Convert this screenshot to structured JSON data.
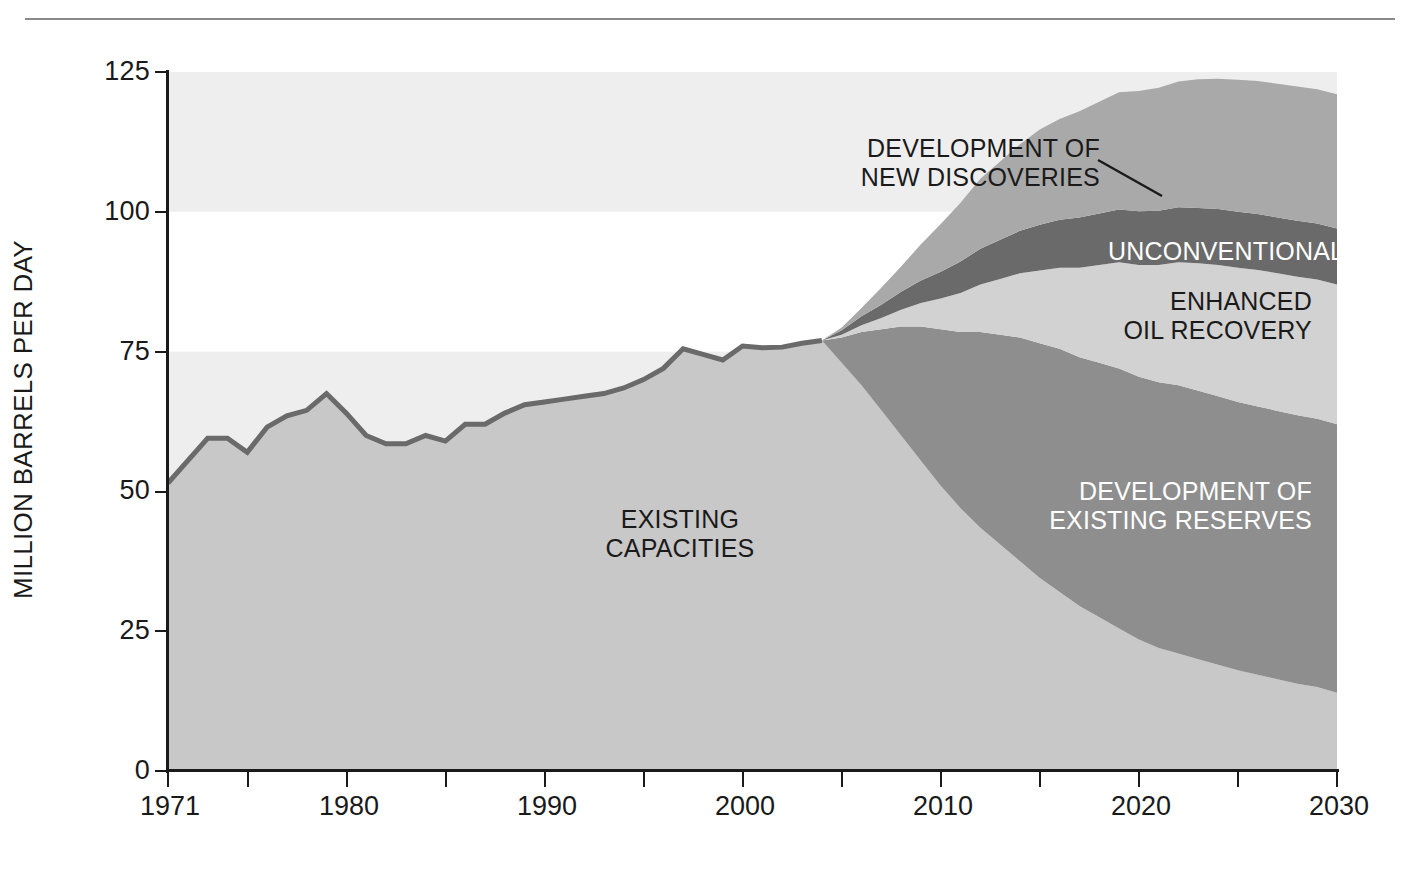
{
  "figure": {
    "y_axis_title": "MILLION BARRELS PER DAY",
    "y_ticks": [
      "0",
      "25",
      "50",
      "75",
      "100",
      "125"
    ],
    "x_ticks_labeled": [
      "1971",
      "1980",
      "1990",
      "2000",
      "2010",
      "2020",
      "2030"
    ]
  },
  "annotations": {
    "new_discoveries": "DEVELOPMENT OF\nNEW DISCOVERIES",
    "unconventional": "UNCONVENTIONAL",
    "enhanced_oil_recovery": "ENHANCED\nOIL RECOVERY",
    "existing_reserves": "DEVELOPMENT OF\nEXISTING RESERVES",
    "existing_capacities": "EXISTING\nCAPACITIES"
  },
  "colors": {
    "band_light": "#eeeeee",
    "band_white": "#ffffff",
    "existing_capacities": "#c8c8c8",
    "existing_reserves": "#8e8e8e",
    "enhanced_oil_recovery": "#d2d2d2",
    "unconventional": "#6a6a6a",
    "new_discoveries": "#a9a9a9",
    "axis": "#1a1a1a",
    "rule": "#8a8a8a"
  },
  "chart_data": {
    "type": "area",
    "title": "",
    "xlabel": "",
    "ylabel": "MILLION BARRELS PER DAY",
    "xlim": [
      1971,
      2030
    ],
    "ylim": [
      0,
      125
    ],
    "grid": "horizontal alternating shaded bands every 25 units",
    "legend": "in-plot labels on each stacked band",
    "stacking": "bottom-to-top: existing capacities, development of existing reserves, enhanced oil recovery, unconventional, development of new discoveries",
    "x": [
      1971,
      1972,
      1973,
      1974,
      1975,
      1976,
      1977,
      1978,
      1979,
      1980,
      1981,
      1982,
      1983,
      1984,
      1985,
      1986,
      1987,
      1988,
      1989,
      1990,
      1991,
      1992,
      1993,
      1994,
      1995,
      1996,
      1997,
      1998,
      1999,
      2000,
      2001,
      2002,
      2003,
      2004,
      2005,
      2006,
      2007,
      2008,
      2009,
      2010,
      2011,
      2012,
      2013,
      2014,
      2015,
      2016,
      2017,
      2018,
      2019,
      2020,
      2021,
      2022,
      2023,
      2024,
      2025,
      2026,
      2027,
      2028,
      2029,
      2030
    ],
    "series": [
      {
        "name": "EXISTING CAPACITIES",
        "color": "#c8c8c8",
        "values": [
          51.5,
          55.5,
          59.5,
          59.5,
          57.0,
          61.5,
          63.5,
          64.5,
          67.5,
          64.0,
          60.0,
          58.5,
          58.5,
          60.0,
          59.0,
          62.0,
          62.0,
          64.0,
          65.5,
          66.0,
          66.5,
          67.0,
          67.5,
          68.5,
          70.0,
          72.0,
          75.5,
          74.5,
          73.5,
          76.0,
          75.7,
          75.8,
          76.5,
          77.0,
          73.0,
          69.0,
          64.5,
          60.0,
          55.5,
          51.0,
          47.0,
          43.5,
          40.5,
          37.5,
          34.5,
          32.0,
          29.5,
          27.5,
          25.5,
          23.5,
          22.0,
          21.0,
          20.0,
          19.0,
          18.0,
          17.2,
          16.4,
          15.6,
          15.0,
          14.0
        ]
      },
      {
        "name": "DEVELOPMENT OF EXISTING RESERVES",
        "color": "#8e8e8e",
        "values": [
          0,
          0,
          0,
          0,
          0,
          0,
          0,
          0,
          0,
          0,
          0,
          0,
          0,
          0,
          0,
          0,
          0,
          0,
          0,
          0,
          0,
          0,
          0,
          0,
          0,
          0,
          0,
          0,
          0,
          0,
          0,
          0,
          0,
          0,
          4.5,
          9.5,
          14.5,
          19.5,
          24.0,
          28.0,
          31.5,
          35.0,
          37.5,
          40.0,
          42.0,
          43.5,
          44.5,
          45.5,
          46.5,
          47.0,
          47.5,
          48.0,
          48.0,
          48.0,
          48.0,
          48.0,
          48.0,
          48.0,
          48.0,
          48.0
        ]
      },
      {
        "name": "ENHANCED OIL RECOVERY",
        "color": "#d2d2d2",
        "values": [
          0,
          0,
          0,
          0,
          0,
          0,
          0,
          0,
          0,
          0,
          0,
          0,
          0,
          0,
          0,
          0,
          0,
          0,
          0,
          0,
          0,
          0,
          0,
          0,
          0,
          0,
          0,
          0,
          0,
          0,
          0,
          0,
          0,
          0,
          0.5,
          1.2,
          2.0,
          3.0,
          4.2,
          5.5,
          7.0,
          8.5,
          10.0,
          11.5,
          13.0,
          14.5,
          16.0,
          17.5,
          19.0,
          20.0,
          21.0,
          22.0,
          22.8,
          23.5,
          24.0,
          24.4,
          24.6,
          24.8,
          24.9,
          25.0
        ]
      },
      {
        "name": "UNCONVENTIONAL",
        "color": "#6a6a6a",
        "values": [
          0,
          0,
          0,
          0,
          0,
          0,
          0,
          0,
          0,
          0,
          0,
          0,
          0,
          0,
          0,
          0,
          0,
          0,
          0,
          0,
          0,
          0,
          0,
          0,
          0,
          0,
          0,
          0,
          0,
          0,
          0,
          0,
          0,
          0,
          0.8,
          1.6,
          2.4,
          3.2,
          4.0,
          4.8,
          5.6,
          6.4,
          7.0,
          7.6,
          8.2,
          8.6,
          9.0,
          9.2,
          9.4,
          9.6,
          9.7,
          9.8,
          9.9,
          10.0,
          10.0,
          10.0,
          10.0,
          10.0,
          10.0,
          10.0
        ]
      },
      {
        "name": "DEVELOPMENT OF NEW DISCOVERIES",
        "color": "#a9a9a9",
        "values": [
          0,
          0,
          0,
          0,
          0,
          0,
          0,
          0,
          0,
          0,
          0,
          0,
          0,
          0,
          0,
          0,
          0,
          0,
          0,
          0,
          0,
          0,
          0,
          0,
          0,
          0,
          0,
          0,
          0,
          0,
          0,
          0,
          0,
          0,
          0.5,
          1.5,
          3.0,
          4.5,
          6.5,
          8.5,
          10.5,
          12.5,
          14.0,
          15.5,
          17.0,
          18.0,
          19.0,
          20.0,
          21.0,
          21.5,
          22.0,
          22.5,
          23.0,
          23.3,
          23.6,
          23.8,
          23.9,
          24.0,
          24.0,
          24.0
        ]
      }
    ],
    "total_top": [
      51.5,
      55.5,
      59.5,
      59.5,
      57.0,
      61.5,
      63.5,
      64.5,
      67.5,
      64.0,
      60.0,
      58.5,
      58.5,
      60.0,
      59.0,
      62.0,
      62.0,
      64.0,
      65.5,
      66.0,
      66.5,
      67.0,
      67.5,
      68.5,
      70.0,
      72.0,
      75.5,
      74.5,
      73.5,
      76.0,
      75.7,
      75.8,
      76.5,
      77.0,
      79.3,
      82.8,
      86.4,
      90.2,
      94.2,
      97.8,
      101.6,
      105.9,
      109.0,
      112.1,
      114.7,
      116.6,
      118.0,
      119.7,
      121.4,
      121.6,
      122.2,
      123.3,
      123.7,
      123.8,
      124.0,
      123.4,
      122.9,
      122.4,
      121.9,
      121.0
    ]
  }
}
